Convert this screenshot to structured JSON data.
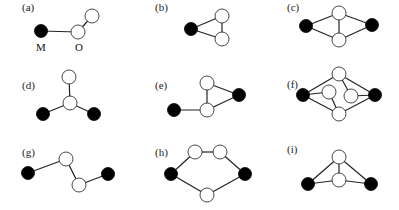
{
  "figure": {
    "panels": [
      {
        "id": "a",
        "label": "(a)",
        "label_pos": [
          22,
          11
        ],
        "nodes": [
          {
            "x": 41,
            "y": 31,
            "type": "metal"
          },
          {
            "x": 78,
            "y": 32,
            "type": "oxygen"
          },
          {
            "x": 92,
            "y": 16,
            "type": "oxygen"
          }
        ],
        "edges": [
          [
            0,
            1
          ],
          [
            1,
            2
          ]
        ],
        "atom_labels": [
          {
            "text": "M",
            "x": 41,
            "y": 51
          },
          {
            "text": "O",
            "x": 79,
            "y": 51
          }
        ]
      },
      {
        "id": "b",
        "label": "(b)",
        "label_pos": [
          155,
          11
        ],
        "nodes": [
          {
            "x": 191,
            "y": 29,
            "type": "metal"
          },
          {
            "x": 222,
            "y": 16,
            "type": "oxygen"
          },
          {
            "x": 222,
            "y": 39,
            "type": "oxygen"
          }
        ],
        "edges": [
          [
            0,
            1
          ],
          [
            0,
            2
          ],
          [
            1,
            2
          ]
        ]
      },
      {
        "id": "c",
        "label": "(c)",
        "label_pos": [
          287,
          11
        ],
        "nodes": [
          {
            "x": 306,
            "y": 26,
            "type": "metal"
          },
          {
            "x": 339,
            "y": 13,
            "type": "oxygen"
          },
          {
            "x": 339,
            "y": 40,
            "type": "oxygen"
          },
          {
            "x": 372,
            "y": 25,
            "type": "metal"
          }
        ],
        "edges": [
          [
            0,
            1
          ],
          [
            0,
            2
          ],
          [
            1,
            2
          ],
          [
            1,
            3
          ],
          [
            2,
            3
          ]
        ]
      },
      {
        "id": "d",
        "label": "(d)",
        "label_pos": [
          22,
          89
        ],
        "nodes": [
          {
            "x": 69,
            "y": 77,
            "type": "oxygen"
          },
          {
            "x": 70,
            "y": 103,
            "type": "oxygen"
          },
          {
            "x": 43,
            "y": 114,
            "type": "metal"
          },
          {
            "x": 94,
            "y": 114,
            "type": "metal"
          }
        ],
        "edges": [
          [
            0,
            1
          ],
          [
            1,
            2
          ],
          [
            1,
            3
          ]
        ]
      },
      {
        "id": "e",
        "label": "(e)",
        "label_pos": [
          155,
          89
        ],
        "nodes": [
          {
            "x": 207,
            "y": 83,
            "type": "oxygen"
          },
          {
            "x": 207,
            "y": 110,
            "type": "oxygen"
          },
          {
            "x": 239,
            "y": 95,
            "type": "metal"
          },
          {
            "x": 174,
            "y": 110,
            "type": "metal"
          }
        ],
        "edges": [
          [
            0,
            1
          ],
          [
            0,
            2
          ],
          [
            1,
            2
          ],
          [
            1,
            3
          ]
        ]
      },
      {
        "id": "f",
        "label": "(f)",
        "label_pos": [
          287,
          88
        ],
        "nodes": [
          {
            "x": 303,
            "y": 95,
            "type": "metal"
          },
          {
            "x": 339,
            "y": 74,
            "type": "oxygen"
          },
          {
            "x": 329,
            "y": 92,
            "type": "oxygen"
          },
          {
            "x": 351,
            "y": 96,
            "type": "oxygen"
          },
          {
            "x": 339,
            "y": 114,
            "type": "oxygen"
          },
          {
            "x": 375,
            "y": 95,
            "type": "metal"
          }
        ],
        "edges": [
          [
            0,
            1
          ],
          [
            0,
            2
          ],
          [
            0,
            4
          ],
          [
            5,
            1
          ],
          [
            5,
            3
          ],
          [
            5,
            4
          ],
          [
            1,
            3
          ],
          [
            2,
            4
          ]
        ]
      },
      {
        "id": "g",
        "label": "(g)",
        "label_pos": [
          22,
          156
        ],
        "nodes": [
          {
            "x": 28,
            "y": 173,
            "type": "metal"
          },
          {
            "x": 66,
            "y": 159,
            "type": "oxygen"
          },
          {
            "x": 79,
            "y": 185,
            "type": "oxygen"
          },
          {
            "x": 108,
            "y": 174,
            "type": "metal"
          }
        ],
        "edges": [
          [
            0,
            1
          ],
          [
            1,
            2
          ],
          [
            2,
            3
          ]
        ]
      },
      {
        "id": "h",
        "label": "(h)",
        "label_pos": [
          155,
          156
        ],
        "nodes": [
          {
            "x": 171,
            "y": 174,
            "type": "metal"
          },
          {
            "x": 195,
            "y": 152,
            "type": "oxygen"
          },
          {
            "x": 220,
            "y": 152,
            "type": "oxygen"
          },
          {
            "x": 245,
            "y": 174,
            "type": "metal"
          },
          {
            "x": 207,
            "y": 195,
            "type": "oxygen"
          }
        ],
        "edges": [
          [
            0,
            1
          ],
          [
            1,
            2
          ],
          [
            2,
            3
          ],
          [
            3,
            4
          ],
          [
            4,
            0
          ]
        ]
      },
      {
        "id": "i",
        "label": "(i)",
        "label_pos": [
          287,
          153
        ],
        "nodes": [
          {
            "x": 339,
            "y": 157,
            "type": "oxygen"
          },
          {
            "x": 339,
            "y": 180,
            "type": "oxygen"
          },
          {
            "x": 308,
            "y": 184,
            "type": "metal"
          },
          {
            "x": 371,
            "y": 184,
            "type": "metal"
          }
        ],
        "edges": [
          [
            0,
            1
          ],
          [
            0,
            2
          ],
          [
            0,
            3
          ],
          [
            1,
            2
          ],
          [
            1,
            3
          ]
        ]
      }
    ],
    "node_radius": 7,
    "colors": {
      "metal": "#000000",
      "oxygen": "#ffffff",
      "edge": "#222222"
    }
  }
}
